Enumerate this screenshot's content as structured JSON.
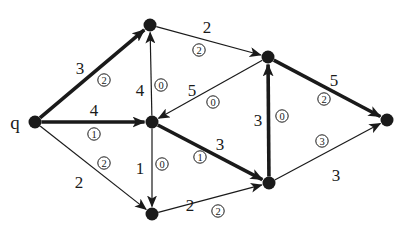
{
  "diagram": {
    "type": "flow-network",
    "source_label": "q",
    "colors": {
      "ink": "#1a1a1a",
      "background": "#ffffff"
    },
    "nodes": [
      {
        "id": "q",
        "label": "q",
        "x": 35,
        "y": 122
      },
      {
        "id": "A",
        "label": "",
        "x": 150,
        "y": 25
      },
      {
        "id": "B",
        "label": "",
        "x": 152,
        "y": 122
      },
      {
        "id": "C",
        "label": "",
        "x": 152,
        "y": 214
      },
      {
        "id": "D",
        "label": "",
        "x": 268,
        "y": 57
      },
      {
        "id": "E",
        "label": "",
        "x": 269,
        "y": 183
      },
      {
        "id": "F",
        "label": "",
        "x": 387,
        "y": 120
      }
    ],
    "edges": [
      {
        "from": "q",
        "to": "A",
        "capacity": "3",
        "flow": "2",
        "bold": true,
        "cap_pos": [
          80,
          68
        ],
        "flow_pos": [
          104,
          80
        ]
      },
      {
        "from": "q",
        "to": "B",
        "capacity": "4",
        "flow": "1",
        "bold": true,
        "cap_pos": [
          94,
          110
        ],
        "flow_pos": [
          94,
          134
        ]
      },
      {
        "from": "q",
        "to": "C",
        "capacity": "2",
        "flow": "2",
        "bold": false,
        "cap_pos": [
          79,
          182
        ],
        "flow_pos": [
          104,
          163
        ]
      },
      {
        "from": "B",
        "to": "A",
        "capacity": "4",
        "flow": "0",
        "bold": false,
        "cap_pos": [
          140,
          90
        ],
        "flow_pos": [
          161,
          85
        ]
      },
      {
        "from": "B",
        "to": "C",
        "capacity": "1",
        "flow": "0",
        "bold": false,
        "cap_pos": [
          140,
          168
        ],
        "flow_pos": [
          162,
          164
        ]
      },
      {
        "from": "A",
        "to": "D",
        "capacity": "2",
        "flow": "2",
        "bold": false,
        "cap_pos": [
          207,
          27
        ],
        "flow_pos": [
          199,
          50
        ]
      },
      {
        "from": "D",
        "to": "B",
        "capacity": "5",
        "flow": "0",
        "bold": false,
        "cap_pos": [
          192,
          90
        ],
        "flow_pos": [
          213,
          102
        ]
      },
      {
        "from": "B",
        "to": "E",
        "capacity": "3",
        "flow": "1",
        "bold": true,
        "cap_pos": [
          220,
          144
        ],
        "flow_pos": [
          200,
          157
        ]
      },
      {
        "from": "E",
        "to": "D",
        "capacity": "3",
        "flow": "0",
        "bold": false,
        "cap_pos": [
          258,
          120
        ],
        "flow_pos": [
          282,
          116
        ],
        "thick": true
      },
      {
        "from": "C",
        "to": "E",
        "capacity": "2",
        "flow": "2",
        "bold": false,
        "cap_pos": [
          190,
          205
        ],
        "flow_pos": [
          218,
          211
        ]
      },
      {
        "from": "D",
        "to": "F",
        "capacity": "5",
        "flow": "2",
        "bold": true,
        "cap_pos": [
          334,
          80
        ],
        "flow_pos": [
          324,
          99
        ]
      },
      {
        "from": "E",
        "to": "F",
        "capacity": "3",
        "flow": "3",
        "bold": false,
        "cap_pos": [
          336,
          175
        ],
        "flow_pos": [
          322,
          141
        ]
      }
    ]
  }
}
